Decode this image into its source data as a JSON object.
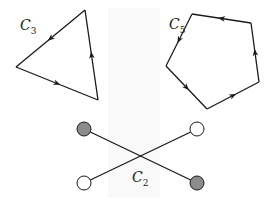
{
  "diagram": {
    "title": "",
    "colors": {
      "stroke": "#1a1a1a",
      "node_filled": "#8c8c8c",
      "node_empty": "#ffffff",
      "background": "#ffffff"
    },
    "cycles": [
      {
        "id": "C3",
        "label_main": "C",
        "label_sub": "3",
        "label_pos": [
          20,
          18
        ],
        "vertices": [
          [
            85,
            10
          ],
          [
            16,
            67
          ],
          [
            98,
            100
          ]
        ],
        "arrow_direction": "along path: top → left → bottom-right → top"
      },
      {
        "id": "C5",
        "label_main": "C",
        "label_sub": "5",
        "label_pos": [
          169,
          17
        ],
        "vertices": [
          [
            251,
            23
          ],
          [
            192,
            14
          ],
          [
            166,
            66
          ],
          [
            207,
            109
          ],
          [
            259,
            82
          ]
        ],
        "arrow_direction": "along path: top-right → top-left → left → bottom → right → top-right"
      },
      {
        "id": "C2",
        "label_main": "C",
        "label_sub": "2",
        "label_pos": [
          132,
          170
        ],
        "nodes": [
          {
            "pos": [
              84,
              129
            ],
            "fill": "filled"
          },
          {
            "pos": [
              197,
              129
            ],
            "fill": "empty"
          },
          {
            "pos": [
              84,
              183
            ],
            "fill": "empty"
          },
          {
            "pos": [
              197,
              183
            ],
            "fill": "filled"
          }
        ],
        "edges": [
          [
            0,
            3
          ],
          [
            2,
            1
          ]
        ]
      }
    ]
  }
}
